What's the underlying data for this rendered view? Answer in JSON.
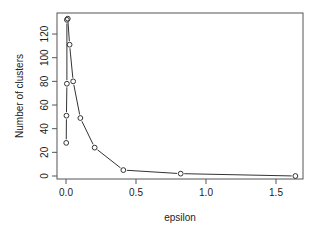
{
  "chart_data": {
    "type": "line",
    "title": "",
    "xlabel": "epsilon",
    "ylabel": "Number of clusters",
    "xlim": [
      0,
      1.6384
    ],
    "ylim": [
      0,
      133
    ],
    "grid": false,
    "legend": null,
    "markers": "open circles",
    "x_ticks": [
      0.0,
      0.5,
      1.0,
      1.5
    ],
    "x_tick_labels": [
      "0.0",
      "0.5",
      "1.0",
      "1.5"
    ],
    "y_ticks": [
      0,
      20,
      40,
      60,
      80,
      100,
      120
    ],
    "y_tick_labels": [
      "0",
      "20",
      "40",
      "60",
      "80",
      "100",
      "120"
    ],
    "series": [
      {
        "name": "clusters",
        "x": [
          0.0016,
          0.0032,
          0.0064,
          0.0064,
          0.0128,
          0.0256,
          0.0512,
          0.1024,
          0.2048,
          0.4096,
          0.8192,
          1.6384
        ],
        "y": [
          28,
          51,
          78,
          132,
          133,
          111,
          80,
          49,
          24,
          5,
          2,
          0
        ]
      }
    ]
  }
}
